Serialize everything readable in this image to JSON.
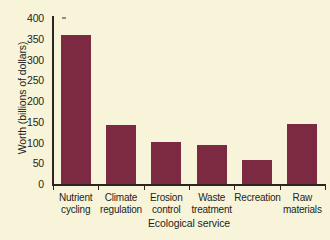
{
  "chart_data": {
    "type": "bar",
    "title": "",
    "xlabel": "Ecological service",
    "ylabel": "Worth (billions of dollars)",
    "categories": [
      "Nutrient cycling",
      "Climate regulation",
      "Erosion control",
      "Waste treatment",
      "Recreation",
      "Raw materials"
    ],
    "category_lines": [
      [
        "Nutrient",
        "cycling"
      ],
      [
        "Climate",
        "regulation"
      ],
      [
        "Erosion",
        "control"
      ],
      [
        "Waste",
        "treatment"
      ],
      [
        "Recreation",
        ""
      ],
      [
        "Raw",
        "materials"
      ]
    ],
    "values": [
      360,
      143,
      102,
      95,
      58,
      145
    ],
    "ylim": [
      0,
      400
    ],
    "yticks": [
      0,
      50,
      100,
      150,
      200,
      250,
      300,
      350,
      400
    ],
    "ytick_labels": [
      "0",
      "50",
      "100",
      "150",
      "200",
      "250",
      "300",
      "350",
      "400"
    ],
    "grid": false,
    "legend": null,
    "bar_color": "#7c2a41",
    "background_color": "#f8f4da",
    "axis_color": "#2c2523",
    "text_color": "#231f20"
  }
}
